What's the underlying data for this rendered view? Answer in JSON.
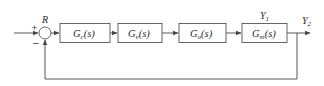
{
  "diagram": {
    "type": "block-diagram",
    "summing_junction": {
      "label": "R",
      "plus_sign": "+",
      "minus_sign": "−"
    },
    "blocks": [
      {
        "id": "controller",
        "main": "G",
        "sub": "c",
        "arg": "(s)"
      },
      {
        "id": "valve",
        "main": "G",
        "sub": "v",
        "arg": "(s)"
      },
      {
        "id": "process",
        "main": "G",
        "sub": "o",
        "arg": "(s)"
      },
      {
        "id": "measurement",
        "main": "G",
        "sub": "m",
        "arg": "(s)"
      }
    ],
    "signals": {
      "y1": {
        "main": "Y",
        "sub": "1"
      },
      "y2": {
        "main": "Y",
        "sub": "2"
      }
    },
    "colors": {
      "line": "#444444",
      "box_border": "#555555",
      "text": "#2a2a2a"
    }
  }
}
